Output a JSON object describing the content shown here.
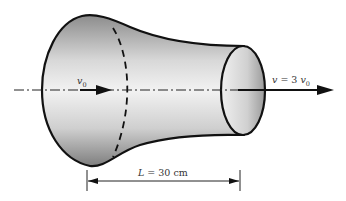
{
  "diagram": {
    "type": "fluid-flow-nozzle",
    "inlet_velocity_label": "v",
    "inlet_velocity_sub": "0",
    "outlet_velocity_label": "v = 3",
    "outlet_velocity_var": "v",
    "outlet_velocity_sub": "0",
    "length_label_var": "L",
    "length_label_rest": " = 30 cm",
    "colors": {
      "outline": "#111111",
      "fill_light": "#f4f4f4",
      "fill_dark": "#9a9a9a",
      "axis": "#222222"
    }
  }
}
